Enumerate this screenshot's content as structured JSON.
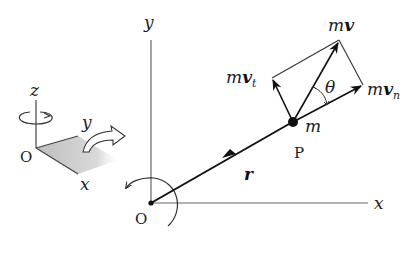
{
  "diagram": {
    "main_axes": {
      "origin_label": "O",
      "x_label": "x",
      "y_label": "y"
    },
    "inset_axes": {
      "origin_label": "O",
      "x_label": "x",
      "y_label": "y",
      "z_label": "z"
    },
    "particle": {
      "point_label": "P",
      "mass_label": "m"
    },
    "position_vector": {
      "label": "r"
    },
    "momentum": {
      "total_prefix": "m",
      "total_vec": "v",
      "normal_prefix": "m",
      "normal_vec": "v",
      "normal_sub": "n",
      "tangential_prefix": "m",
      "tangential_vec": "v",
      "tangential_sub": "t"
    },
    "angle_label": "θ",
    "colors": {
      "stroke": "#222222",
      "axis": "#555555",
      "shade": "#bdbdbd"
    }
  }
}
